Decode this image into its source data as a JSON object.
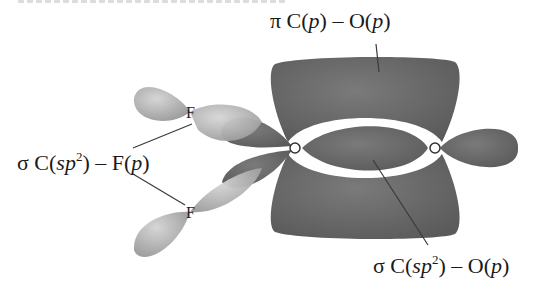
{
  "figure": {
    "molecule": "F2C=O",
    "atoms": [
      {
        "symbol": "F",
        "role": "upper-fluorine"
      },
      {
        "symbol": "F",
        "role": "lower-fluorine"
      },
      {
        "symbol": "C",
        "role": "carbon"
      },
      {
        "symbol": "O",
        "role": "oxygen"
      }
    ],
    "labels": {
      "pi_co": {
        "greek": "π",
        "text_pre": "C(",
        "p1": "p",
        "mid": ") – O(",
        "p2": "p",
        "post": ")"
      },
      "sigma_cf": {
        "greek": "σ",
        "text_pre": "C(",
        "sp": "sp",
        "sup": "2",
        "mid": ") – F(",
        "p": "p",
        "post": ")"
      },
      "sigma_co": {
        "greek": "σ",
        "text_pre": "C(",
        "sp": "sp",
        "sup": "2",
        "mid": ") – O(",
        "p": "p",
        "post": ")"
      }
    },
    "colors": {
      "dark_lobe": "#6a6a6a",
      "light_lobe": "#b8b8b8",
      "label_text": "#1a1a1a",
      "leader_line": "#3a3a3a"
    }
  }
}
